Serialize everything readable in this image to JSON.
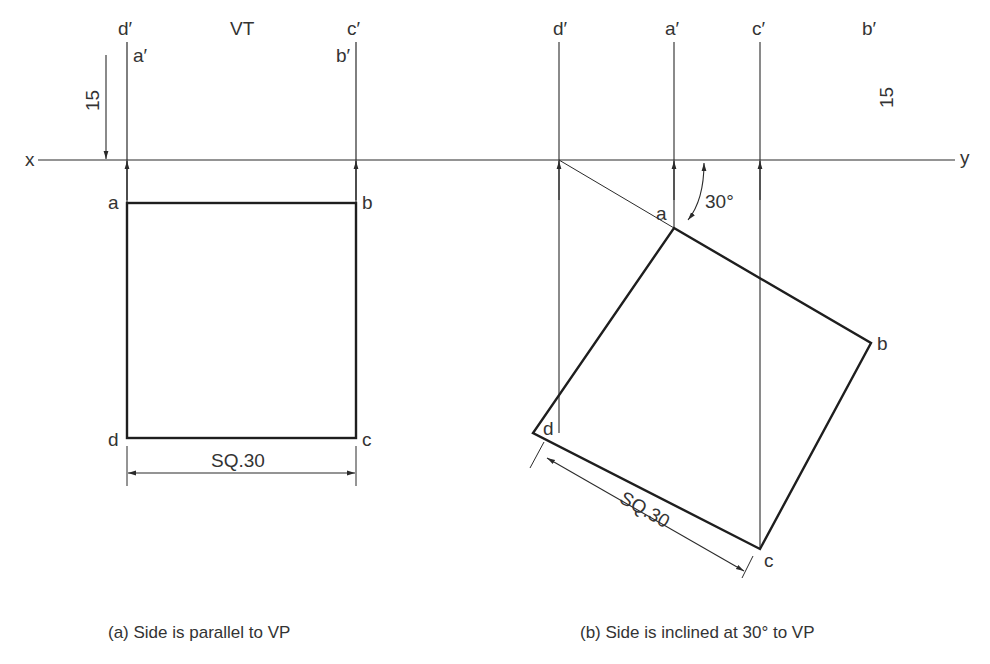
{
  "figure_a": {
    "labels": {
      "d_prime": "d′",
      "a_prime": "a′",
      "c_prime": "c′",
      "b_prime": "b′",
      "vt": "VT",
      "a": "a",
      "b": "b",
      "c": "c",
      "d": "d",
      "x": "x",
      "dim_15": "15",
      "dim_sq": "SQ.30"
    },
    "caption": "(a) Side is parallel to VP"
  },
  "figure_b": {
    "labels": {
      "d_prime": "d′",
      "a_prime": "a′",
      "c_prime": "c′",
      "b_prime": "b′",
      "a": "a",
      "b": "b",
      "c": "c",
      "d": "d",
      "y": "y",
      "dim_15": "15",
      "angle": "30°",
      "dim_sq": "SQ.30"
    },
    "caption": "(b) Side is inclined at 30° to VP"
  },
  "colors": {
    "line": "#2a2a2a",
    "background": "#ffffff"
  }
}
